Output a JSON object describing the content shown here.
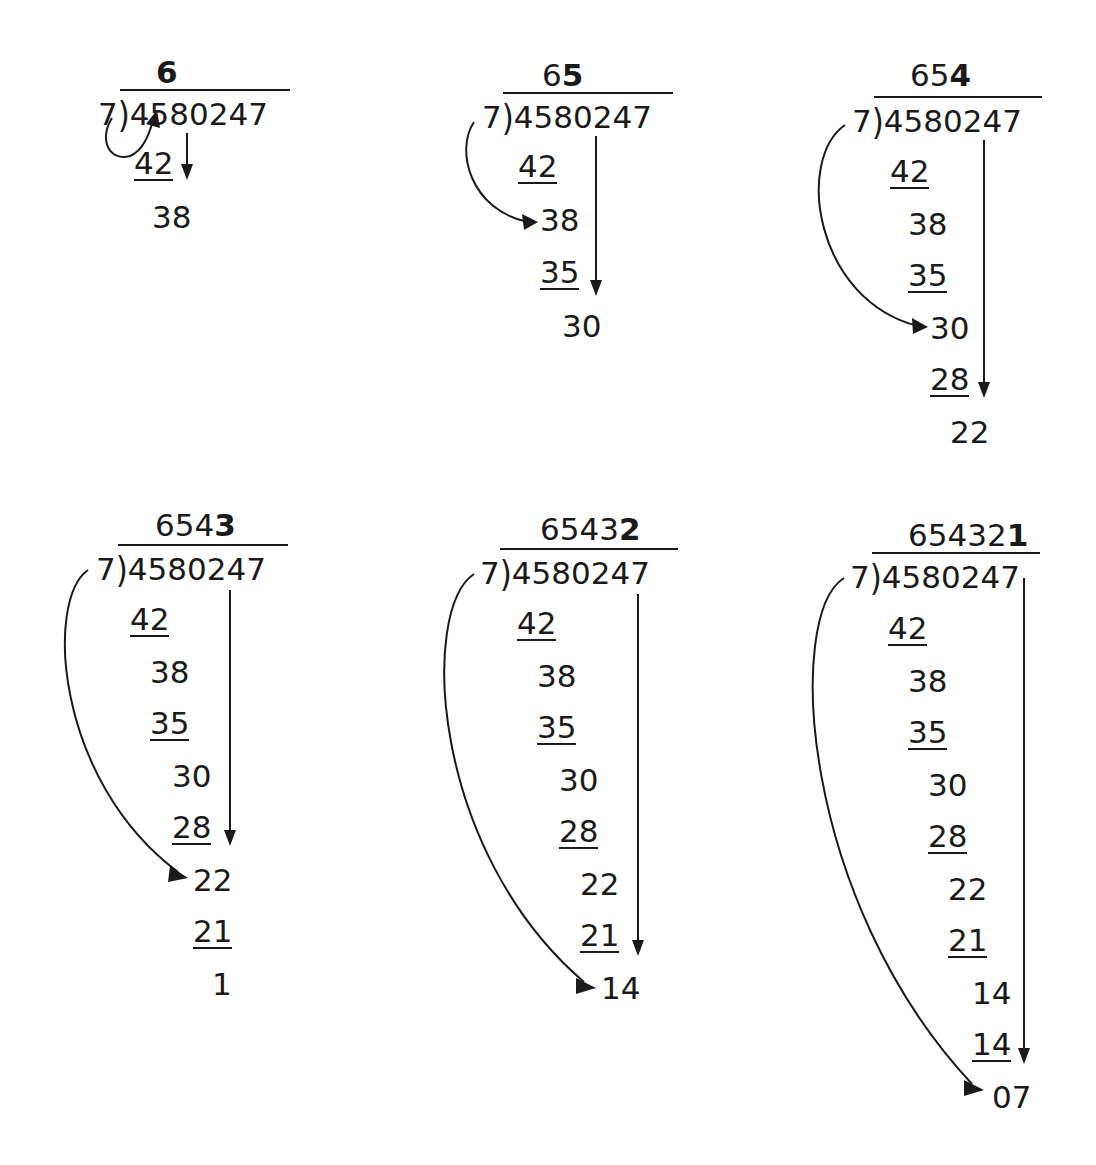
{
  "diagram": {
    "divisor": "7",
    "dividend": "4580247",
    "colors": {
      "ink": "#1a1a1a",
      "background": "#ffffff"
    },
    "panels": [
      {
        "step": 1,
        "quotient_prefix": "",
        "quotient_new_digit": "6",
        "rows": [
          {
            "text": "42",
            "underlined": true
          },
          {
            "text": "38",
            "underlined": false
          }
        ]
      },
      {
        "step": 2,
        "quotient_prefix": "6",
        "quotient_new_digit": "5",
        "rows": [
          {
            "text": "42",
            "underlined": true
          },
          {
            "text": "38",
            "underlined": false
          },
          {
            "text": "35",
            "underlined": true
          },
          {
            "text": "30",
            "underlined": false
          }
        ]
      },
      {
        "step": 3,
        "quotient_prefix": "65",
        "quotient_new_digit": "4",
        "rows": [
          {
            "text": "42",
            "underlined": true
          },
          {
            "text": "38",
            "underlined": false
          },
          {
            "text": "35",
            "underlined": true
          },
          {
            "text": "30",
            "underlined": false
          },
          {
            "text": "28",
            "underlined": true
          },
          {
            "text": "22",
            "underlined": false
          }
        ]
      },
      {
        "step": 4,
        "quotient_prefix": "654",
        "quotient_new_digit": "3",
        "rows": [
          {
            "text": "42",
            "underlined": true
          },
          {
            "text": "38",
            "underlined": false
          },
          {
            "text": "35",
            "underlined": true
          },
          {
            "text": "30",
            "underlined": false
          },
          {
            "text": "28",
            "underlined": true
          },
          {
            "text": "22",
            "underlined": false
          },
          {
            "text": "21",
            "underlined": true
          },
          {
            "text": "1",
            "underlined": false
          }
        ]
      },
      {
        "step": 5,
        "quotient_prefix": "6543",
        "quotient_new_digit": "2",
        "rows": [
          {
            "text": "42",
            "underlined": true
          },
          {
            "text": "38",
            "underlined": false
          },
          {
            "text": "35",
            "underlined": true
          },
          {
            "text": "30",
            "underlined": false
          },
          {
            "text": "28",
            "underlined": true
          },
          {
            "text": "22",
            "underlined": false
          },
          {
            "text": "21",
            "underlined": true
          },
          {
            "text": "14",
            "underlined": false
          }
        ]
      },
      {
        "step": 6,
        "quotient_prefix": "65432",
        "quotient_new_digit": "1",
        "rows": [
          {
            "text": "42",
            "underlined": true
          },
          {
            "text": "38",
            "underlined": false
          },
          {
            "text": "35",
            "underlined": true
          },
          {
            "text": "30",
            "underlined": false
          },
          {
            "text": "28",
            "underlined": true
          },
          {
            "text": "22",
            "underlined": false
          },
          {
            "text": "21",
            "underlined": true
          },
          {
            "text": "14",
            "underlined": false
          },
          {
            "text": "14",
            "underlined": true
          },
          {
            "text": "07",
            "underlined": false
          }
        ]
      }
    ],
    "icons": {
      "curved_arrow": "curved-arrow-icon",
      "down_arrow": "down-arrow-icon"
    }
  }
}
